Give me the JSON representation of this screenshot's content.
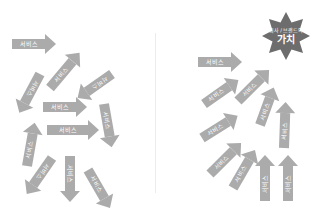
{
  "diagram": {
    "arrow_label": "서비스",
    "arrow_color": "#ababab",
    "value_badge": {
      "line1": "회사 / 브랜드의",
      "line2": "가치",
      "color": "#6d6d6d"
    },
    "left_panel": {
      "description": "scattered service arrows pointing in different directions",
      "arrows": [
        {
          "label": "서비스"
        },
        {
          "label": "서비스"
        },
        {
          "label": "서비스"
        },
        {
          "label": "서비스"
        },
        {
          "label": "서비스"
        },
        {
          "label": "서비스"
        },
        {
          "label": "서비스"
        },
        {
          "label": "서비스"
        },
        {
          "label": "서비스"
        },
        {
          "label": "서비스"
        },
        {
          "label": "서비스"
        }
      ]
    },
    "right_panel": {
      "description": "service arrows aligned toward company/brand value",
      "arrows": [
        {
          "label": "서비스"
        },
        {
          "label": "서비스"
        },
        {
          "label": "서비스"
        },
        {
          "label": "서비스"
        },
        {
          "label": "서비스"
        },
        {
          "label": "서비스"
        },
        {
          "label": "서비스"
        },
        {
          "label": "서비스"
        },
        {
          "label": "서비스"
        }
      ]
    }
  }
}
